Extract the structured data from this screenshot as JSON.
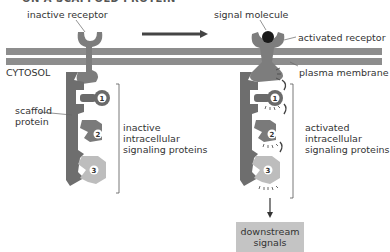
{
  "title": "ON A SCAFFOLD PROTEIN",
  "labels": {
    "inactive_receptor": "inactive receptor",
    "signal_molecule": "signal molecule",
    "activated_receptor": "activated receptor",
    "cytosol": "CYTOSOL",
    "plasma_membrane": "plasma membrane",
    "scaffold_protein_1": "scaffold",
    "scaffold_protein_2": "protein",
    "inactive_1": "inactive",
    "inactive_2": "intracellular",
    "inactive_3": "signaling proteins",
    "activated_1": "activated",
    "activated_2": "intracellular",
    "activated_3": "signaling proteins",
    "downstream_1": "downstream",
    "downstream_2": "signals"
  },
  "proteins": [
    "1",
    "2",
    "3"
  ],
  "colors": {
    "membrane": "#8a8a8a",
    "receptor": "#7d7d7d",
    "scaffold": "#6e6e6e",
    "protein1": "#6a6a6a",
    "protein2": "#7a7a7a",
    "protein3": "#bdbdbd",
    "signal": "#1a1a1a",
    "downstream_box": "#c4c4c4"
  }
}
